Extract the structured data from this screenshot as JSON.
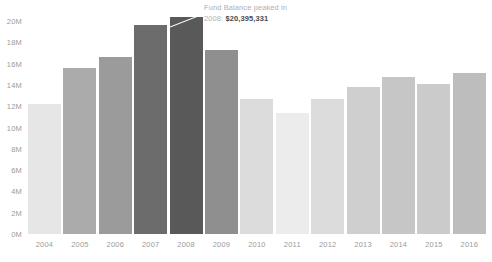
{
  "chart_data": {
    "type": "bar",
    "title": "",
    "subtitle": "",
    "xlabel": "",
    "ylabel": "",
    "grid": false,
    "legend": false,
    "ylim": [
      0,
      20400000
    ],
    "y_ticks": [
      {
        "label": "20M",
        "value": 20000000
      },
      {
        "label": "18M",
        "value": 18000000
      },
      {
        "label": "16M",
        "value": 16000000
      },
      {
        "label": "14M",
        "value": 14000000
      },
      {
        "label": "12M",
        "value": 12000000
      },
      {
        "label": "10M",
        "value": 10000000
      },
      {
        "label": "8M",
        "value": 8000000
      },
      {
        "label": "6M",
        "value": 6000000
      },
      {
        "label": "4M",
        "value": 4000000
      },
      {
        "label": "2M",
        "value": 2000000
      },
      {
        "label": "0M",
        "value": 0
      }
    ],
    "categories": [
      "2004",
      "2005",
      "2006",
      "2007",
      "2008",
      "2009",
      "2010",
      "2011",
      "2012",
      "2013",
      "2014",
      "2015",
      "2016"
    ],
    "values": [
      12200000,
      15600000,
      16600000,
      19600000,
      20395331,
      17300000,
      12700000,
      11400000,
      12700000,
      13800000,
      14700000,
      14100000,
      15100000
    ],
    "bar_colors": [
      "#e6e6e6",
      "#ababab",
      "#9b9b9b",
      "#6c6c6c",
      "#595959",
      "#8f8f8f",
      "#dcdcdc",
      "#ececec",
      "#dcdcdc",
      "#cfcfcf",
      "#c6c6c6",
      "#cbcbcb",
      "#bdbdbd"
    ],
    "annotations": [
      {
        "target_category": "2008",
        "line1": "Fund Balance peaked in",
        "line2_prefix": "2008: ",
        "line2_value": "$20,395,331"
      }
    ]
  },
  "annotation": {
    "line1": "Fund Balance peaked in",
    "prefix": "2008: ",
    "value": "$20,395,331"
  },
  "colors": {
    "axis_text": "#9a9a9a",
    "annotation_text": "#b0b0b0",
    "annotation_value": "#4a4a4a",
    "background": "#ffffff",
    "leader_line": "#ffffff"
  }
}
